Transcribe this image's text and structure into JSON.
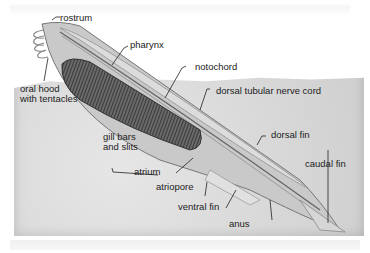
{
  "figure": {
    "labels": {
      "rostrum": "rostrum",
      "pharynx": "pharynx",
      "notochord": "notochord",
      "oral_hood_line1": "oral hood",
      "oral_hood_line2": "with tentacles",
      "dorsal_nerve_cord": "dorsal tubular nerve cord",
      "gill_line1": "gill bars",
      "gill_line2": "and slits",
      "dorsal_fin": "dorsal fin",
      "atrium": "atrium",
      "atriopore": "atriopore",
      "caudal_fin": "caudal fin",
      "ventral_fin": "ventral fin",
      "anus": "anus"
    }
  }
}
